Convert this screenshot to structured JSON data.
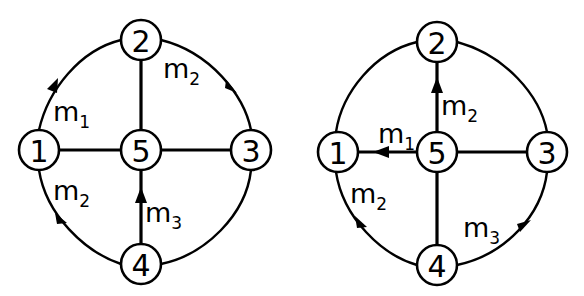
{
  "diagrams": [
    {
      "id": "left",
      "nodes": [
        {
          "label": "1",
          "x": 39,
          "y": 150
        },
        {
          "label": "2",
          "x": 141,
          "y": 40
        },
        {
          "label": "3",
          "x": 251,
          "y": 150
        },
        {
          "label": "4",
          "x": 141,
          "y": 264
        },
        {
          "label": "5",
          "x": 141,
          "y": 150
        }
      ],
      "spokes": [
        {
          "from": "1",
          "to": "5",
          "directed": false
        },
        {
          "from": "2",
          "to": "5",
          "directed": false
        },
        {
          "from": "3",
          "to": "5",
          "directed": false
        },
        {
          "from": "4",
          "to": "5",
          "directed": true,
          "direction": "4->5",
          "label": "m",
          "sub": "3"
        }
      ],
      "arcs": [
        {
          "from": "1",
          "to": "2",
          "directed": true,
          "direction": "1->2",
          "label": "m",
          "sub": "1"
        },
        {
          "from": "2",
          "to": "3",
          "directed": true,
          "direction": "2->3",
          "label": "m",
          "sub": "2"
        },
        {
          "from": "1",
          "to": "4",
          "directed": true,
          "direction": "1->4",
          "label": "m",
          "sub": "2"
        },
        {
          "from": "3",
          "to": "4",
          "directed": false
        }
      ],
      "labels": {
        "m1": {
          "text": "m",
          "sub": "1"
        },
        "m2_top": {
          "text": "m",
          "sub": "2"
        },
        "m2_bottom": {
          "text": "m",
          "sub": "2"
        },
        "m3": {
          "text": "m",
          "sub": "3"
        }
      }
    },
    {
      "id": "right",
      "nodes": [
        {
          "label": "1",
          "x": 338,
          "y": 152
        },
        {
          "label": "2",
          "x": 437,
          "y": 42
        },
        {
          "label": "3",
          "x": 547,
          "y": 152
        },
        {
          "label": "4",
          "x": 437,
          "y": 265
        },
        {
          "label": "5",
          "x": 437,
          "y": 152
        }
      ],
      "spokes": [
        {
          "from": "5",
          "to": "1",
          "directed": true,
          "direction": "5->1",
          "label": "m",
          "sub": "1"
        },
        {
          "from": "5",
          "to": "2",
          "directed": true,
          "direction": "5->2",
          "label": "m",
          "sub": "2"
        },
        {
          "from": "3",
          "to": "5",
          "directed": false
        },
        {
          "from": "4",
          "to": "5",
          "directed": false
        }
      ],
      "arcs": [
        {
          "from": "1",
          "to": "2",
          "directed": false
        },
        {
          "from": "2",
          "to": "3",
          "directed": false
        },
        {
          "from": "1",
          "to": "4",
          "directed": true,
          "direction": "1->4",
          "label": "m",
          "sub": "2"
        },
        {
          "from": "4",
          "to": "3",
          "directed": true,
          "direction": "4->3",
          "label": "m",
          "sub": "3"
        }
      ],
      "labels": {
        "m1": {
          "text": "m",
          "sub": "1"
        },
        "m2_spoke": {
          "text": "m",
          "sub": "2"
        },
        "m2_arc": {
          "text": "m",
          "sub": "2"
        },
        "m3": {
          "text": "m",
          "sub": "3"
        }
      }
    }
  ]
}
